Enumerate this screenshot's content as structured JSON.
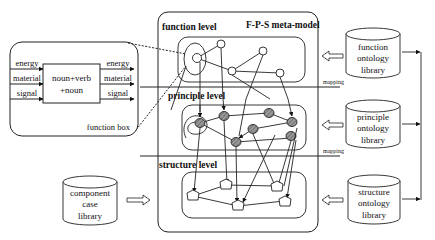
{
  "meta_model": {
    "title": "F-P-S meta-model",
    "levels": [
      {
        "id": "function",
        "label": "function level"
      },
      {
        "id": "principle",
        "label": "principle level"
      },
      {
        "id": "structure",
        "label": "structure level"
      }
    ]
  },
  "function_box": {
    "label": "function box",
    "inputs": [
      "energy",
      "material",
      "signal"
    ],
    "outputs": [
      "energy",
      "material",
      "signal"
    ],
    "core_line1": "noun+verb",
    "core_line2": "+noun"
  },
  "libraries": {
    "function": {
      "line1": "function",
      "line2": "ontology",
      "line3": "library"
    },
    "principle": {
      "line1": "principle",
      "line2": "ontology",
      "line3": "library"
    },
    "structure": {
      "line1": "structure",
      "line2": "ontology",
      "line3": "library"
    },
    "component": {
      "line1": "component",
      "line2": "case",
      "line3": "library"
    }
  },
  "mapping_labels": [
    "mapping",
    "mapping"
  ],
  "colors": {
    "stroke": "#222222",
    "principle_node_fill": "#8a8a8a",
    "background": "#ffffff"
  }
}
